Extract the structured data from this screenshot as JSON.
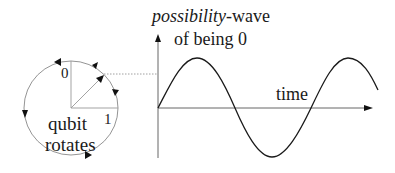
{
  "qubit": {
    "label_zero": "0",
    "label_one": "1",
    "caption_line1": "qubit",
    "caption_line2": "rotates"
  },
  "wave": {
    "title_italic": "possibility",
    "title_rest": "-wave",
    "subtitle": "of being 0",
    "x_label": "time"
  },
  "colors": {
    "circle": "#888888",
    "axis": "#555555",
    "wave": "#1a1a1a",
    "arrowhead": "#111111",
    "dotted": "#888888"
  }
}
